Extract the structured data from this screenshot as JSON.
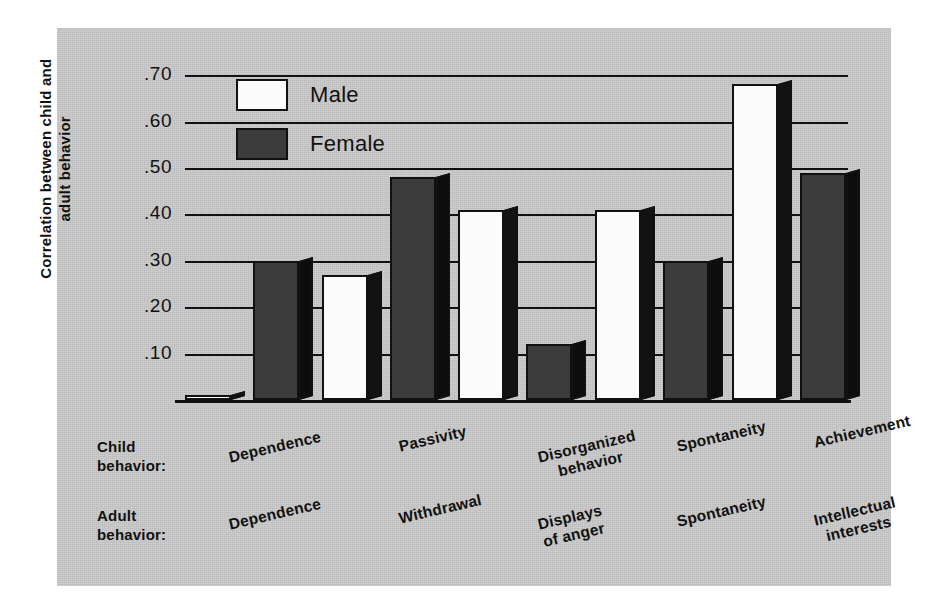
{
  "chart_data": {
    "type": "bar",
    "title": "",
    "xlabel": "",
    "ylabel": "Correlation between child and adult behavior",
    "ylim": [
      0,
      0.75
    ],
    "yticks": [
      ".10",
      ".20",
      ".30",
      ".40",
      ".50",
      ".60",
      ".70"
    ],
    "ytick_values": [
      0.1,
      0.2,
      0.3,
      0.4,
      0.5,
      0.6,
      0.7
    ],
    "grid": true,
    "legend_position": "top-left-inside",
    "categories": [
      "Dependence",
      "Passivity",
      "Disorganized behavior",
      "Spontaneity",
      "Achievement"
    ],
    "child_behavior": [
      "Dependence",
      "Passivity",
      "Disorganized behavior",
      "Spontaneity",
      "Achievement"
    ],
    "adult_behavior": [
      "Dependence",
      "Withdrawal",
      "Displays of anger",
      "Spontaneity",
      "Intellectual interests"
    ],
    "series": [
      {
        "name": "Male",
        "color": "#fbfbfb",
        "values": [
          0.01,
          0.27,
          0.41,
          0.41,
          0.68
        ]
      },
      {
        "name": "Female",
        "color": "#3c3c3c",
        "values": [
          0.3,
          0.48,
          0.12,
          0.3,
          0.49
        ]
      }
    ]
  },
  "axis": {
    "child_row_label_line1": "Child",
    "child_row_label_line2": "behavior:",
    "adult_row_label_line1": "Adult",
    "adult_row_label_line2": "behavior:"
  },
  "legend": {
    "male_label": "Male",
    "female_label": "Female"
  },
  "category_labels": {
    "child": [
      {
        "line1": "Dependence",
        "line2": ""
      },
      {
        "line1": "Passivity",
        "line2": ""
      },
      {
        "line1": "Disorganized",
        "line2": "behavior"
      },
      {
        "line1": "Spontaneity",
        "line2": ""
      },
      {
        "line1": "Achievement",
        "line2": ""
      }
    ],
    "adult": [
      {
        "line1": "Dependence",
        "line2": ""
      },
      {
        "line1": "Withdrawal",
        "line2": ""
      },
      {
        "line1": "Displays",
        "line2": "of anger"
      },
      {
        "line1": "Spontaneity",
        "line2": ""
      },
      {
        "line1": "Intellectual",
        "line2": "interests"
      }
    ]
  },
  "colors": {
    "panel_background": "#c9c9c9",
    "page_background": "#ffffff",
    "ink": "#111111",
    "male_bar": "#fbfbfb",
    "female_bar": "#3c3c3c",
    "bar_side_shadow": "#121212"
  }
}
